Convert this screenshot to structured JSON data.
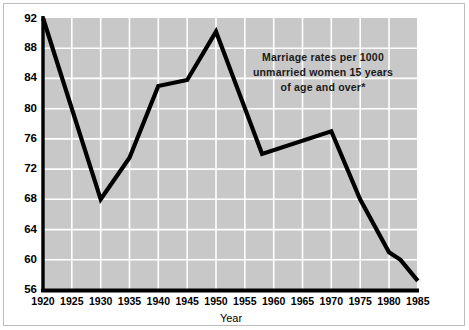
{
  "chart_data": {
    "type": "line",
    "title": "",
    "subtitle": "",
    "xlabel": "Year",
    "ylabel": "",
    "annotation": {
      "lines": [
        "Marriage rates per 1000",
        "unmarried women 15 years",
        "of age and over*"
      ]
    },
    "x": [
      1920,
      1930,
      1935,
      1940,
      1945,
      1950,
      1958,
      1970,
      1975,
      1980,
      1982,
      1985
    ],
    "values": [
      92.0,
      68.0,
      73.5,
      83.0,
      83.8,
      90.2,
      74.0,
      77.0,
      68.0,
      61.0,
      60.0,
      57.2
    ],
    "series": [
      {
        "name": "Marriage rate",
        "values": [
          92.0,
          68.0,
          73.5,
          83.0,
          83.8,
          90.2,
          74.0,
          77.0,
          68.0,
          61.0,
          60.0,
          57.2
        ]
      }
    ],
    "xlim": [
      1920,
      1985
    ],
    "ylim": [
      56,
      92
    ],
    "xticks": [
      1920,
      1925,
      1930,
      1935,
      1940,
      1945,
      1950,
      1955,
      1960,
      1965,
      1970,
      1975,
      1980,
      1985
    ],
    "xtick_labels": [
      "1920",
      "1925",
      "1930",
      "1935",
      "1940",
      "1945",
      "1950",
      "1955",
      "1960",
      "1965",
      "1970",
      "1975",
      "1980",
      "1985"
    ],
    "yticks": [
      56,
      60,
      64,
      68,
      72,
      76,
      80,
      84,
      88,
      92
    ],
    "ytick_labels": [
      "56",
      "60",
      "64",
      "68",
      "72",
      "76",
      "80",
      "84",
      "88",
      "92"
    ],
    "grid": true,
    "grid_color": "#ffffff",
    "plot_background": "#c8c8c8",
    "line_color": "#000000",
    "legend": null,
    "legend_position": "none"
  },
  "axes": {
    "y_label_56": "56",
    "y_label_60": "60",
    "y_label_64": "64",
    "y_label_68": "68",
    "y_label_72": "72",
    "y_label_76": "76",
    "y_label_80": "80",
    "y_label_84": "84",
    "y_label_88": "88",
    "y_label_92": "92",
    "x_label_1920": "1920",
    "x_label_1925": "1925",
    "x_label_1930": "1930",
    "x_label_1935": "1935",
    "x_label_1940": "1940",
    "x_label_1945": "1945",
    "x_label_1950": "1950",
    "x_label_1955": "1955",
    "x_label_1960": "1960",
    "x_label_1965": "1965",
    "x_label_1970": "1970",
    "x_label_1975": "1975",
    "x_label_1980": "1980",
    "x_label_1985": "1985",
    "x_axis_title": "Year"
  },
  "annotation": {
    "line1": "Marriage rates per 1000",
    "line2": "unmarried women 15 years",
    "line3": "of age and over*"
  }
}
